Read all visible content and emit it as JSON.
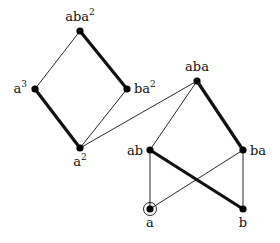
{
  "diagram": {
    "nodes": [
      {
        "id": "aba2",
        "label": "aba",
        "sup": "2",
        "x": 80,
        "y": 31,
        "lx": 80,
        "ly": 21,
        "anchor": "middle"
      },
      {
        "id": "a3",
        "label": "a",
        "sup": "3",
        "x": 35,
        "y": 89,
        "lx": 27,
        "ly": 93,
        "anchor": "end"
      },
      {
        "id": "ba2",
        "label": "ba",
        "sup": "2",
        "x": 127,
        "y": 89,
        "lx": 134,
        "ly": 93,
        "anchor": "start"
      },
      {
        "id": "a2",
        "label": "a",
        "sup": "2",
        "x": 80,
        "y": 148,
        "lx": 80,
        "ly": 166,
        "anchor": "middle"
      },
      {
        "id": "aba",
        "label": "aba",
        "sup": "",
        "x": 197,
        "y": 81,
        "lx": 197,
        "ly": 71,
        "anchor": "middle"
      },
      {
        "id": "ab",
        "label": "ab",
        "sup": "",
        "x": 150,
        "y": 150,
        "lx": 143,
        "ly": 155,
        "anchor": "end"
      },
      {
        "id": "ba",
        "label": "ba",
        "sup": "",
        "x": 243,
        "y": 150,
        "lx": 250,
        "ly": 155,
        "anchor": "start"
      },
      {
        "id": "a",
        "label": "a",
        "sup": "",
        "x": 150,
        "y": 209,
        "lx": 150,
        "ly": 227,
        "anchor": "middle",
        "circled": true
      },
      {
        "id": "b",
        "label": "b",
        "sup": "",
        "x": 243,
        "y": 209,
        "lx": 243,
        "ly": 227,
        "anchor": "middle"
      }
    ],
    "edges": [
      {
        "from": "aba2",
        "to": "a3",
        "thick": false
      },
      {
        "from": "aba2",
        "to": "ba2",
        "thick": true
      },
      {
        "from": "a3",
        "to": "a2",
        "thick": true
      },
      {
        "from": "ba2",
        "to": "a2",
        "thick": false
      },
      {
        "from": "a2",
        "to": "aba",
        "thick": false
      },
      {
        "from": "aba",
        "to": "ab",
        "thick": false
      },
      {
        "from": "aba",
        "to": "ba",
        "thick": true
      },
      {
        "from": "ab",
        "to": "b",
        "thick": true
      },
      {
        "from": "ab",
        "to": "a",
        "thick": false
      },
      {
        "from": "ba",
        "to": "a",
        "thick": false
      },
      {
        "from": "ba",
        "to": "b",
        "thick": false
      }
    ],
    "colors": {
      "line": "#111111",
      "node": "#000000",
      "background": "#ffffff"
    }
  }
}
